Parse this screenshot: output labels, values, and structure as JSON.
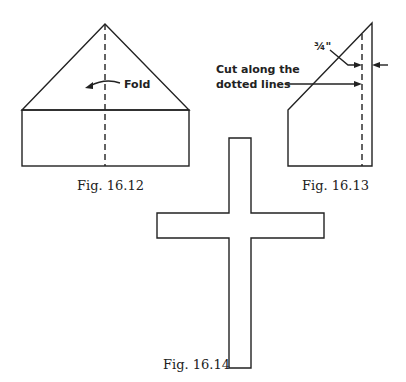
{
  "figures": [
    {
      "id": "fig-16-12",
      "caption": "Fig. 16.12",
      "annotation": "Fold"
    },
    {
      "id": "fig-16-13",
      "caption": "Fig. 16.13",
      "measure": "¾\"",
      "instruction_line1": "Cut along the",
      "instruction_line2": "dotted lines"
    },
    {
      "id": "fig-16-14",
      "caption": "Fig. 16.14"
    }
  ],
  "colors": {
    "stroke": "#222222",
    "background": "#ffffff"
  }
}
